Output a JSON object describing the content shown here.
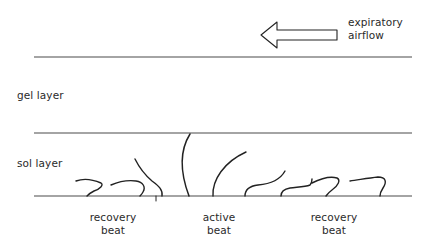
{
  "diagram": {
    "type": "schematic",
    "arrow": {
      "label_line1": "expiratory",
      "label_line2": "airflow",
      "direction": "left"
    },
    "layers": [
      {
        "label": "gel layer"
      },
      {
        "label": "sol layer"
      }
    ],
    "beat_labels": [
      {
        "line1": "recovery",
        "line2": "beat"
      },
      {
        "line1": "active",
        "line2": "beat"
      },
      {
        "line1": "recovery",
        "line2": "beat"
      }
    ],
    "colors": {
      "line": "#222222",
      "boundary": "#4a4a4a",
      "text": "#2a2a2a",
      "background": "#ffffff"
    }
  }
}
